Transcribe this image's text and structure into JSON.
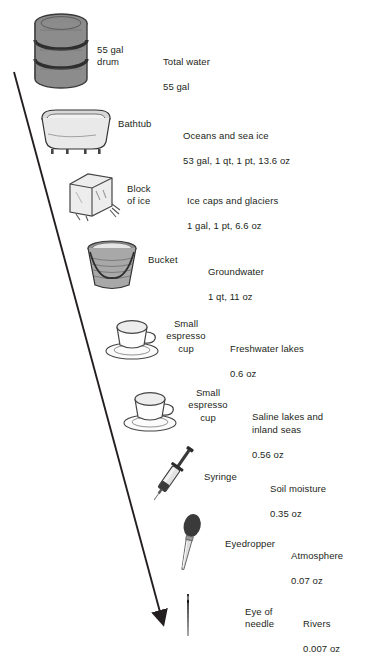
{
  "diagram": {
    "type": "scale-comparison-infographic",
    "title_visible": false,
    "arrow": {
      "name": "diagonal-arrow",
      "from": [
        14,
        72
      ],
      "to": [
        166,
        622
      ],
      "color": "#231f20"
    },
    "rows": [
      {
        "id": "total-water",
        "icon": "drum-icon",
        "container_label": "55 gal\ndrum",
        "description": "Total water",
        "amount": "55 gal",
        "icon_x": 30,
        "icon_y": 12,
        "icon_w": 62,
        "icon_h": 78,
        "label_x": 97,
        "label_y": 44,
        "label_w": 56,
        "label_align": "left",
        "desc_x": 163,
        "desc_y": 44
      },
      {
        "id": "oceans-and-sea-ice",
        "icon": "bathtub-icon",
        "container_label": "Bathtub",
        "description": "Oceans and sea ice",
        "amount": "53 gal, 1 qt, 1 pt, 13.6 oz",
        "icon_x": 36,
        "icon_y": 108,
        "icon_w": 76,
        "icon_h": 46,
        "label_x": 118,
        "label_y": 118,
        "label_w": 50,
        "label_align": "left",
        "desc_x": 183,
        "desc_y": 118
      },
      {
        "id": "ice-caps-and-glaciers",
        "icon": "ice-block-icon",
        "container_label": "Block\nof ice",
        "description": "Ice caps and glaciers",
        "amount": "1 gal, 1 pt, 6.6 oz",
        "icon_x": 62,
        "icon_y": 170,
        "icon_w": 58,
        "icon_h": 50,
        "label_x": 127,
        "label_y": 183,
        "label_w": 46,
        "label_align": "left",
        "desc_x": 187,
        "desc_y": 183
      },
      {
        "id": "groundwater",
        "icon": "bucket-icon",
        "container_label": "Bucket",
        "description": "Groundwater",
        "amount": "1 qt, 11 oz",
        "icon_x": 82,
        "icon_y": 238,
        "icon_w": 58,
        "icon_h": 54,
        "label_x": 148,
        "label_y": 254,
        "label_w": 46,
        "label_align": "left",
        "desc_x": 208,
        "desc_y": 254
      },
      {
        "id": "freshwater-lakes",
        "icon": "espresso-cup-icon",
        "container_label": "Small\nespresso\ncup",
        "description": "Freshwater lakes",
        "amount": "0.6 oz",
        "icon_x": 104,
        "icon_y": 313,
        "icon_w": 58,
        "icon_h": 48,
        "label_x": 160,
        "label_y": 318,
        "label_w": 52,
        "label_align": "center",
        "desc_x": 230,
        "desc_y": 331
      },
      {
        "id": "saline-lakes-and-inland-seas",
        "icon": "espresso-cup-icon",
        "container_label": "Small\nespresso\ncup",
        "description": "Saline lakes and\ninland seas",
        "amount": "0.56 oz",
        "icon_x": 122,
        "icon_y": 385,
        "icon_w": 58,
        "icon_h": 48,
        "label_x": 182,
        "label_y": 387,
        "label_w": 52,
        "label_align": "center",
        "desc_x": 252,
        "desc_y": 399
      },
      {
        "id": "soil-moisture",
        "icon": "syringe-icon",
        "container_label": "Syringe",
        "description": "Soil moisture",
        "amount": "0.35 oz",
        "icon_x": 145,
        "icon_y": 438,
        "icon_w": 52,
        "icon_h": 68,
        "label_x": 204,
        "label_y": 471,
        "label_w": 50,
        "label_align": "left",
        "desc_x": 270,
        "desc_y": 471
      },
      {
        "id": "atmosphere",
        "icon": "eyedropper-icon",
        "container_label": "Eyedropper",
        "description": "Atmosphere",
        "amount": "0.07 oz",
        "icon_x": 168,
        "icon_y": 512,
        "icon_w": 38,
        "icon_h": 64,
        "label_x": 225,
        "label_y": 538,
        "label_w": 58,
        "label_align": "left",
        "desc_x": 291,
        "desc_y": 538
      },
      {
        "id": "rivers",
        "icon": "needle-icon",
        "container_label": "Eye of\nneedle",
        "description": "Rivers",
        "amount": "0.007 oz",
        "icon_x": 178,
        "icon_y": 592,
        "icon_w": 18,
        "icon_h": 46,
        "label_x": 245,
        "label_y": 606,
        "label_w": 44,
        "label_align": "left",
        "desc_x": 303,
        "desc_y": 606
      }
    ]
  }
}
